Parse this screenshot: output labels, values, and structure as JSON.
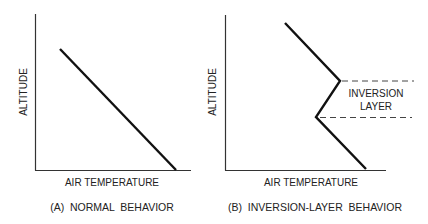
{
  "panels": [
    {
      "id": "A",
      "caption": "(A)  NORMAL  BEHAVIOR",
      "x_axis_label": "AIR  TEMPERATURE",
      "y_axis_label": "ALTITUDE"
    },
    {
      "id": "B",
      "caption": "(B)  INVERSION-LAYER  BEHAVIOR",
      "x_axis_label": "AIR  TEMPERATURE",
      "y_axis_label": "ALTITUDE",
      "annotation_line1": "INVERSION",
      "annotation_line2": "LAYER"
    }
  ],
  "colors": {
    "line": "#111111",
    "axis": "#333333",
    "dashed": "#444444",
    "text": "#222222"
  }
}
